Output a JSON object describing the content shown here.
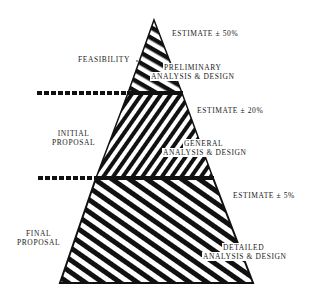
{
  "diagram": {
    "type": "pyramid",
    "colors": {
      "ink": "#111111",
      "paper": "#ffffff"
    },
    "stages": [
      {
        "label_line1": "FEASIBILITY",
        "label_line2": ""
      },
      {
        "label_line1": "INITIAL",
        "label_line2": "PROPOSAL"
      },
      {
        "label_line1": "FINAL",
        "label_line2": "PROPOSAL"
      }
    ],
    "layers": [
      {
        "line1": "PRELIMINARY",
        "line2": "ANALYSIS & DESIGN",
        "estimate": "ESTIMATE ± 50%"
      },
      {
        "line1": "GENERAL",
        "line2": "ANALYSIS & DESIGN",
        "estimate": "ESTIMATE ± 20%"
      },
      {
        "line1": "DETAILED",
        "line2": "ANALYSIS & DESIGN",
        "estimate": "ESTIMATE ± 5%"
      }
    ]
  }
}
